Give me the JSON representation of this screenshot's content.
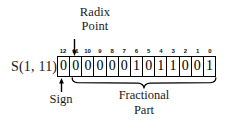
{
  "diagram": {
    "title_top": {
      "line1": "Radix",
      "line2": "Point"
    },
    "format_label": "S(1, 11)",
    "sign_label": "Sign",
    "fractional_label": {
      "line1": "Fractional",
      "line2": "Part"
    },
    "bit_indices": [
      "12",
      "11",
      "10",
      "9",
      "8",
      "7",
      "6",
      "5",
      "4",
      "3",
      "2",
      "1",
      "0"
    ],
    "bit_values": [
      "0",
      "0",
      "0",
      "0",
      "0",
      "0",
      "1",
      "0",
      "1",
      "1",
      "0",
      "0",
      "1"
    ],
    "icons": {
      "radix_arrow": "arrow-down-icon",
      "sign_arrow": "arrow-up-icon",
      "fractional_brace": "curly-brace-icon"
    },
    "colors": {
      "ink": "#000000",
      "background": "#ffffff"
    }
  }
}
